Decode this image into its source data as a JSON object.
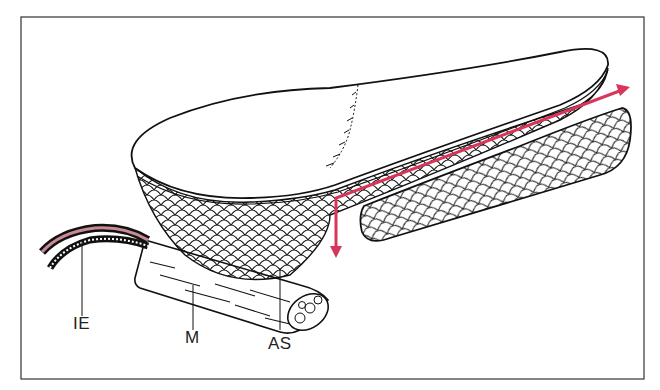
{
  "figure": {
    "kind": "anatomical illustration",
    "labels": [
      {
        "id": "IE",
        "text": "IE"
      },
      {
        "id": "M",
        "text": "M"
      },
      {
        "id": "AS",
        "text": "AS"
      }
    ],
    "colors": {
      "line": "#111111",
      "arrow": "#d9345a",
      "nerve_accent": "#c98a96",
      "background": "#ffffff"
    }
  }
}
